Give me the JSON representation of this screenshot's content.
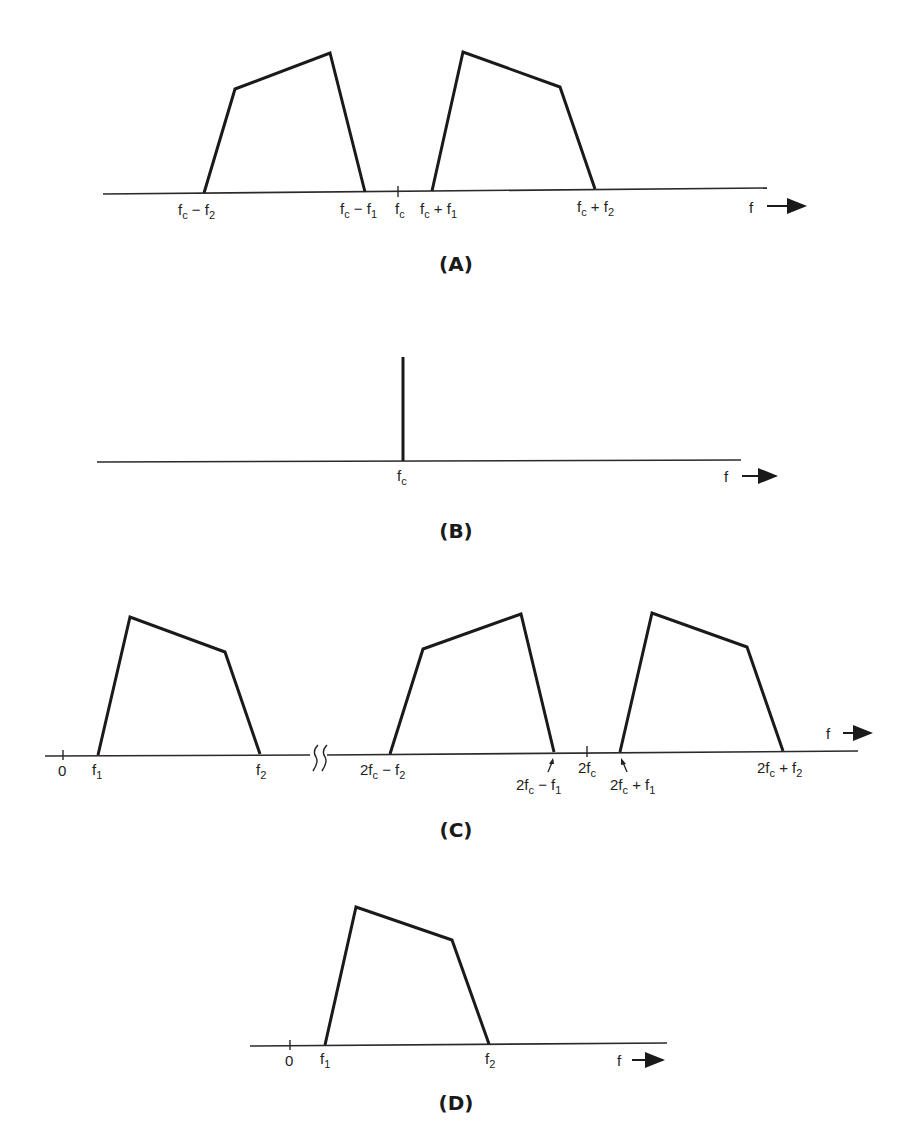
{
  "figure": {
    "panels": [
      {
        "id": "A",
        "caption": "(A)",
        "description": "DSB spectrum: lower and upper sidebands around carrier fc",
        "axis_label": "f",
        "labels": [
          {
            "main": "f",
            "sub": "c",
            "rest": " − f",
            "sub2": "2"
          },
          {
            "main": "f",
            "sub": "c",
            "rest": " − f",
            "sub2": "1"
          },
          {
            "main": "f",
            "sub": "c",
            "rest": "",
            "sub2": ""
          },
          {
            "main": "f",
            "sub": "c",
            "rest": " + f",
            "sub2": "1"
          },
          {
            "main": "f",
            "sub": "c",
            "rest": " + f",
            "sub2": "2"
          }
        ]
      },
      {
        "id": "B",
        "caption": "(B)",
        "description": "Carrier spectral line at fc",
        "axis_label": "f",
        "labels": [
          {
            "main": "f",
            "sub": "c"
          }
        ]
      },
      {
        "id": "C",
        "caption": "(C)",
        "description": "Product detector output: baseband plus components around 2fc",
        "axis_label": "f",
        "labels": [
          {
            "main": "0"
          },
          {
            "main": "f",
            "sub": "1"
          },
          {
            "main": "f",
            "sub": "2"
          },
          {
            "main": "2f",
            "sub": "c",
            "rest": " − f",
            "sub2": "2"
          },
          {
            "main": "2f",
            "sub": "c",
            "rest": " − f",
            "sub2": "1"
          },
          {
            "main": "2f",
            "sub": "c"
          },
          {
            "main": "2f",
            "sub": "c",
            "rest": " + f",
            "sub2": "1"
          },
          {
            "main": "2f",
            "sub": "c",
            "rest": " + f",
            "sub2": "2"
          }
        ]
      },
      {
        "id": "D",
        "caption": "(D)",
        "description": "Recovered baseband after low-pass filtering",
        "axis_label": "f",
        "labels": [
          {
            "main": "0"
          },
          {
            "main": "f",
            "sub": "1"
          },
          {
            "main": "f",
            "sub": "2"
          }
        ]
      }
    ]
  }
}
